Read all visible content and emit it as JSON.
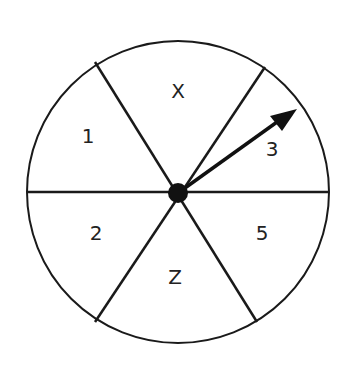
{
  "spinner": {
    "sections": [
      {
        "label": "X"
      },
      {
        "label": "1"
      },
      {
        "label": "3"
      },
      {
        "label": "2"
      },
      {
        "label": "5"
      },
      {
        "label": "Z"
      }
    ],
    "pointer": "arrow pointing into section 3"
  }
}
